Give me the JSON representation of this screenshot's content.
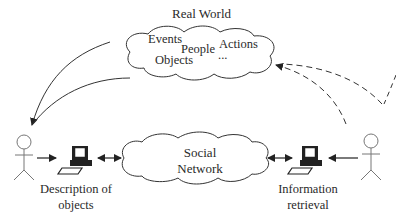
{
  "diagram": {
    "real_world": {
      "title": "Real World",
      "items": [
        "Events",
        "People",
        "Actions",
        "Objects",
        "..."
      ]
    },
    "social_network": {
      "line1": "Social",
      "line2": "Network"
    },
    "left_node": {
      "line1": "Description of",
      "line2": "objects"
    },
    "right_node": {
      "line1": "Information",
      "line2": "retrieval"
    },
    "colors": {
      "stroke": "#333333",
      "text": "#2a2a2a",
      "background": "#ffffff"
    }
  }
}
